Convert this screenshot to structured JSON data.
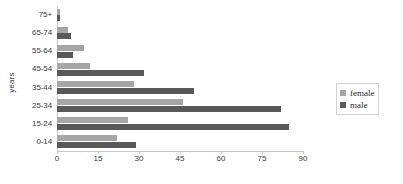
{
  "chart_data": {
    "type": "bar",
    "orientation": "horizontal",
    "title": "",
    "xlabel": "",
    "ylabel": "years",
    "categories": [
      "0-14",
      "15-24",
      "25-34",
      "35-44",
      "45-54",
      "55-64",
      "65-74",
      "75+"
    ],
    "series": [
      {
        "name": "female",
        "color": "#a6a6a6",
        "values": [
          22,
          26,
          46,
          28,
          12,
          10,
          4,
          1
        ]
      },
      {
        "name": "male",
        "color": "#595959",
        "values": [
          29,
          85,
          82,
          50,
          32,
          6,
          5,
          1
        ]
      }
    ],
    "xlim": [
      0,
      90
    ],
    "xticks": [
      0,
      15,
      30,
      45,
      60,
      75,
      90
    ],
    "grid": false,
    "legend_position": "right"
  },
  "axes": {
    "y_title": "years"
  },
  "legend": {
    "items": [
      {
        "label": "female",
        "color": "#a6a6a6"
      },
      {
        "label": "male",
        "color": "#595959"
      }
    ]
  }
}
